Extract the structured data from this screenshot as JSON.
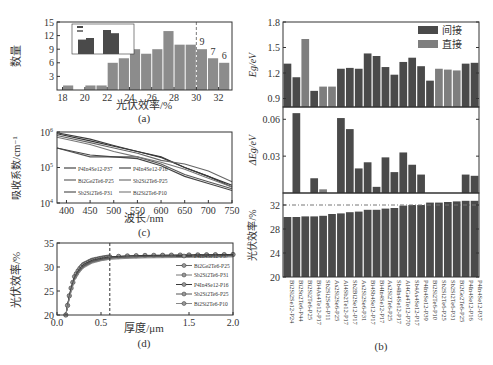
{
  "chart_data": [
    {
      "panel": "a",
      "type": "bar",
      "caption": "(a)",
      "xlabel": "光伏效率/%",
      "ylabel": "数量",
      "xticks": [
        18,
        20,
        22,
        24,
        26,
        28,
        30,
        32
      ],
      "yticks": [
        3,
        6,
        9,
        12,
        15
      ],
      "xlim": [
        17.5,
        33.2
      ],
      "ylim": [
        0,
        15
      ],
      "bins": [
        18,
        19,
        20,
        21,
        22,
        23,
        24,
        25,
        26,
        27,
        28,
        29,
        30,
        31,
        32
      ],
      "values": [
        1,
        0,
        1,
        1,
        6,
        7,
        9,
        8,
        9,
        13,
        10,
        10,
        9,
        7,
        6
      ],
      "annotations": [
        {
          "x": 30.5,
          "text": "9"
        },
        {
          "x": 31.5,
          "text": "7"
        },
        {
          "x": 32.5,
          "text": "6"
        }
      ],
      "vline": 30,
      "inset": {
        "legend": [
          "间接",
          "直接"
        ],
        "bars": [
          [
            24,
            25
          ],
          [
            30,
            28
          ]
        ]
      }
    },
    {
      "panel": "b",
      "type": "bar",
      "caption": "(b)",
      "categories": [
        "Bi2Si2Se12-P24",
        "Bi2Sn2Te6-P44",
        "Bi2Si2Te6-P25",
        "Bi4As4Te12-P17",
        "Sb2Si2Se6-P11",
        "As2Si2Se6-P25",
        "Al4Sb2Te12-P17",
        "Sb2Bi2Se12-P17",
        "As2Si2Se6-P31",
        "Bi4Sb4Se12-P17",
        "Bi4In4Se12-P17",
        "As2Si2Te6-P25",
        "Sb4In4Se12-P17",
        "Al4Ga4Te12-P70",
        "Sb4As4Se12-P17",
        "P4In4Se12-P39",
        "Bi2Si2Te6-P10",
        "Sb2Si2Te6-P25",
        "Sb2Si2Te6-P31",
        "Bi2Ge2Te6-P25",
        "P4In4Se12-P16",
        "P4In4Se12-P37"
      ],
      "gap_type": [
        "间接",
        "间接",
        "直接",
        "间接",
        "直接",
        "直接",
        "间接",
        "间接",
        "间接",
        "间接",
        "间接",
        "间接",
        "间接",
        "间接",
        "间接",
        "间接",
        "间接",
        "直接",
        "直接",
        "直接",
        "间接",
        "间接"
      ],
      "legend": [
        "间接",
        "直接"
      ],
      "subplots": [
        {
          "ylabel": "Eg/eV",
          "yticks": [
            0.9,
            1.2,
            1.5,
            1.8
          ],
          "ylim": [
            0.8,
            1.8
          ],
          "values": [
            1.31,
            1.15,
            1.6,
            0.99,
            1.04,
            1.04,
            1.25,
            1.26,
            1.25,
            1.43,
            1.4,
            1.27,
            1.18,
            1.33,
            1.38,
            1.28,
            1.11,
            1.25,
            1.24,
            1.23,
            1.31,
            1.32
          ]
        },
        {
          "ylabel": "ΔEg/eV",
          "yticks": [
            0.03,
            0.06
          ],
          "ylim": [
            0,
            0.07
          ],
          "values": [
            0,
            0.065,
            0,
            0.012,
            0.003,
            0,
            0.061,
            0.052,
            0.02,
            0.025,
            0.005,
            0.029,
            0.017,
            0.033,
            0.023,
            0.015,
            0,
            0,
            0,
            0,
            0.015,
            0.014
          ]
        },
        {
          "ylabel": "光伏效率/%",
          "yticks": [
            20,
            24,
            28,
            32
          ],
          "ylim": [
            20,
            34
          ],
          "hline": 32,
          "values": [
            30.0,
            30.0,
            30.1,
            30.1,
            30.2,
            30.5,
            30.6,
            30.8,
            30.9,
            31.2,
            31.2,
            31.4,
            31.5,
            31.9,
            32.0,
            32.0,
            32.4,
            32.4,
            32.5,
            32.6,
            32.7,
            32.7
          ]
        }
      ]
    },
    {
      "panel": "c",
      "type": "line",
      "caption": "(c)",
      "xlabel": "波长/nm",
      "ylabel": "吸收系数/cm⁻¹",
      "xticks": [
        400,
        450,
        500,
        550,
        600,
        650,
        700,
        750
      ],
      "yticks": [
        "10^4",
        "10^5",
        "10^6"
      ],
      "xlim": [
        380,
        750
      ],
      "ylim_log10": [
        4,
        6
      ],
      "x": [
        380,
        450,
        500,
        550,
        600,
        650,
        700,
        750
      ],
      "series": [
        {
          "name": "P4In4Se12-P37",
          "log10_values": [
            5.95,
            5.75,
            5.6,
            5.45,
            5.3,
            5.0,
            4.75,
            4.5
          ]
        },
        {
          "name": "Bi2Ge2Te6-P25",
          "log10_values": [
            5.55,
            5.3,
            5.3,
            5.3,
            5.1,
            4.8,
            4.6,
            4.4
          ]
        },
        {
          "name": "Sb2Si2Te6-P31",
          "log10_values": [
            5.55,
            5.35,
            5.3,
            5.25,
            5.05,
            4.75,
            4.55,
            4.35
          ]
        },
        {
          "name": "P4In4Se12-P16",
          "log10_values": [
            5.98,
            5.8,
            5.62,
            5.45,
            5.28,
            5.0,
            4.75,
            4.45
          ]
        },
        {
          "name": "Sb2Si2Te6-P25",
          "log10_values": [
            5.9,
            5.7,
            5.55,
            5.4,
            5.2,
            5.1,
            4.9,
            4.6
          ]
        },
        {
          "name": "Bi2Si2Te6-P10",
          "log10_values": [
            5.85,
            5.65,
            5.45,
            5.3,
            5.15,
            4.95,
            4.7,
            4.45
          ]
        }
      ]
    },
    {
      "panel": "d",
      "type": "line",
      "caption": "(d)",
      "xlabel": "厚度/μm",
      "ylabel": "光伏效率/%",
      "xticks": [
        0.0,
        0.5,
        1.5,
        2.0
      ],
      "yticks": [
        20,
        25,
        30,
        35
      ],
      "xlim": [
        0,
        2.0
      ],
      "ylim": [
        20,
        35
      ],
      "vline": 0.6,
      "x": [
        0.1,
        0.15,
        0.2,
        0.25,
        0.3,
        0.4,
        0.5,
        0.6,
        0.8,
        1.0,
        1.5,
        2.0
      ],
      "series": [
        {
          "name": "P4In4Se12-P37",
          "values": [
            20,
            25,
            28,
            29.5,
            30.5,
            31.4,
            31.8,
            32.1,
            32.3,
            32.4,
            32.5,
            32.6
          ]
        },
        {
          "name": "Bi2Ge2Te6-P25",
          "values": [
            20,
            24.5,
            27.5,
            29,
            30,
            31,
            31.5,
            31.8,
            32.0,
            32.1,
            32.2,
            32.3
          ]
        },
        {
          "name": "Sb2Si2Te6-P31",
          "values": [
            20,
            24.5,
            27.5,
            29,
            30,
            31,
            31.5,
            31.8,
            32.0,
            32.1,
            32.2,
            32.3
          ]
        },
        {
          "name": "P4In4Se12-P16",
          "values": [
            20,
            25,
            28,
            29.5,
            30.5,
            31.4,
            31.8,
            32.1,
            32.3,
            32.4,
            32.5,
            32.6
          ]
        },
        {
          "name": "Sb2Si2Te6-P25",
          "values": [
            20,
            24.8,
            27.8,
            29.2,
            30.2,
            31.2,
            31.6,
            31.9,
            32.1,
            32.2,
            32.3,
            32.4
          ]
        },
        {
          "name": "Bi2Si2Te6-P10",
          "values": [
            20,
            24.2,
            27.2,
            28.8,
            29.8,
            30.8,
            31.3,
            31.6,
            31.8,
            31.9,
            32.0,
            32.1
          ]
        }
      ]
    }
  ],
  "colors": {
    "indirect": "#4a4a4a",
    "direct": "#7e7e7e",
    "axis": "#333333",
    "grid_dash": "#777777"
  },
  "labels": {
    "a_caption": "(a)",
    "b_caption": "(b)",
    "c_caption": "(c)",
    "d_caption": "(d)",
    "a_xlabel": "光伏效率/%",
    "a_ylabel": "数量",
    "b_ylabel_eg": "Eg/eV",
    "b_ylabel_deg": "ΔEg/eV",
    "b_ylabel_pce": "光伏效率/%",
    "c_xlabel": "波长/nm",
    "c_ylabel": "吸收系数/cm⁻¹",
    "d_xlabel": "厚度/μm",
    "d_ylabel": "光伏效率/%",
    "legend_indirect": "间接",
    "legend_direct": "直接"
  }
}
